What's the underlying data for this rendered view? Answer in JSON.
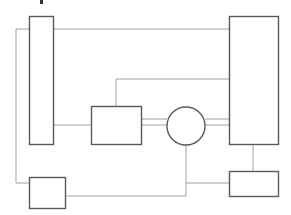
{
  "diagram": {
    "title_fragment": "",
    "colors": {
      "box_stroke": "#5a5a5a",
      "connector_stroke": "#a0a0a0",
      "background": "#ffffff"
    },
    "nodes": [
      {
        "id": "left-tall-rect",
        "shape": "rect",
        "x": 29,
        "y": 16,
        "w": 24,
        "h": 128
      },
      {
        "id": "right-tall-rect",
        "shape": "rect",
        "x": 229,
        "y": 16,
        "w": 49,
        "h": 128
      },
      {
        "id": "middle-box",
        "shape": "rect",
        "x": 91,
        "y": 106,
        "w": 50,
        "h": 38
      },
      {
        "id": "circle-node",
        "shape": "circle",
        "cx": 186,
        "cy": 126,
        "r": 19
      },
      {
        "id": "bottom-left-box",
        "shape": "rect",
        "x": 29,
        "y": 177,
        "w": 36,
        "h": 31
      },
      {
        "id": "bottom-right-box",
        "shape": "rect",
        "x": 229,
        "y": 171,
        "w": 49,
        "h": 25
      }
    ],
    "connectors": [
      {
        "id": "left-rect-to-right-rect-top",
        "points": "53,29 229,29"
      },
      {
        "id": "left-outer-loop",
        "points": "29,29 16,29 16,183 29,183"
      },
      {
        "id": "left-rect-to-middle-box",
        "points": "53,125 91,125"
      },
      {
        "id": "middle-box-to-right-rect",
        "points": "116,106 116,79 229,79"
      },
      {
        "id": "middle-box-to-circle-upper",
        "points": "141,119 167,119"
      },
      {
        "id": "middle-box-to-circle-lower",
        "points": "141,125 167,125"
      },
      {
        "id": "circle-to-right-rect-upper",
        "points": "205,119 229,119"
      },
      {
        "id": "circle-to-right-rect-lower",
        "points": "205,125 229,125"
      },
      {
        "id": "right-rect-to-bottom-right-box",
        "points": "253,144 253,171"
      },
      {
        "id": "bottom-left-box-to-circle",
        "points": "65,196 186,196 186,145"
      },
      {
        "id": "circle-line-to-bottom-right-box",
        "points": "186,183 229,183"
      }
    ]
  }
}
